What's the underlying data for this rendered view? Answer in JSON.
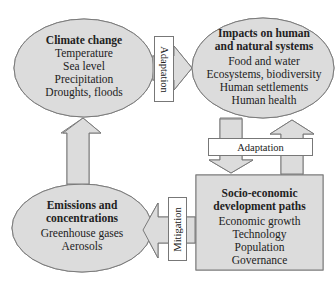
{
  "diagram": {
    "colors": {
      "fill": "#dcdcdc",
      "stroke": "#7a7a7a",
      "label_bg": "#ffffff"
    },
    "nodes": {
      "climate_change": {
        "title": "Climate change",
        "items": [
          "Temperature",
          "Sea level",
          "Precipitation",
          "Droughts, floods"
        ]
      },
      "impacts": {
        "title_line1": "Impacts on human",
        "title_line2": "and natural systems",
        "items": [
          "Food and water",
          "Ecosystems, biodiversity",
          "Human settlements",
          "Human health"
        ]
      },
      "emissions": {
        "title_line1": "Emissions and",
        "title_line2": "concentrations",
        "items": [
          "Greenhouse gases",
          "Aerosols"
        ]
      },
      "socio_economic": {
        "title_line1": "Socio-economic",
        "title_line2": "development paths",
        "items": [
          "Economic growth",
          "Technology",
          "Population",
          "Governance"
        ]
      }
    },
    "edges": {
      "climate_to_impacts": {
        "label": "Adaptation"
      },
      "impacts_socio": {
        "label": "Adaptation"
      },
      "socio_to_emissions": {
        "label": "Mitigation"
      },
      "emissions_to_climate": {
        "label": ""
      }
    }
  }
}
